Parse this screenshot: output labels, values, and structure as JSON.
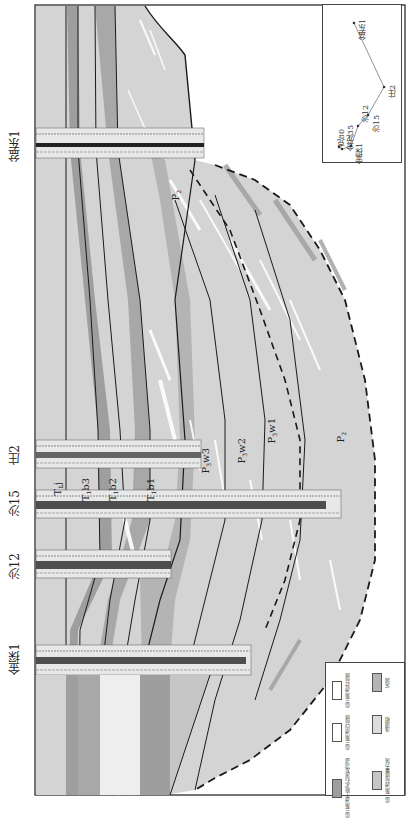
{
  "figure": {
    "type": "well-correlation cross-section (rotated 90°)",
    "colors": {
      "frame": "#1a1a1a",
      "outer_front": "#d4d4d4",
      "inner_front": "#e6e6e6",
      "distributary_channel": "#9e9e9e",
      "shore_mud": "#b4b4b4",
      "shallow_lake": "#dcdcdc",
      "fan_delta_front_sheet": "#c6c6c6",
      "white_sand": "#ffffff"
    }
  },
  "wells": [
    {
      "name": "盆东1",
      "y": 145
    },
    {
      "name": "庄2",
      "y": 455
    },
    {
      "name": "沙15",
      "y": 505
    },
    {
      "name": "沙12",
      "y": 565
    },
    {
      "name": "金探1",
      "y": 660
    }
  ],
  "well_log_tracks": [
    "GR",
    "SP",
    "RT",
    "AC"
  ],
  "strata_labels": [
    {
      "text": "T",
      "sub": "1",
      "sup": "j",
      "full": "T1j",
      "x": 58,
      "y": 500
    },
    {
      "text": "T",
      "sub": "1",
      "sup": "b3",
      "full": "T1b3",
      "x": 85,
      "y": 500
    },
    {
      "text": "T",
      "sub": "1",
      "sup": "b2",
      "full": "T1b2",
      "x": 110,
      "y": 500
    },
    {
      "text": "T",
      "sub": "1",
      "sup": "b1",
      "full": "T1b1",
      "x": 148,
      "y": 500
    },
    {
      "text": "P",
      "sub": "3",
      "sup": "w3",
      "full": "P3w3",
      "x": 205,
      "y": 470
    },
    {
      "text": "P",
      "sub": "3",
      "sup": "w2",
      "full": "P3w2",
      "x": 240,
      "y": 460
    },
    {
      "text": "P",
      "sub": "3",
      "sup": "w1",
      "full": "P3w1",
      "x": 270,
      "y": 440
    },
    {
      "text": "P",
      "sub": "2",
      "sup": "",
      "full": "P2 (lower)",
      "x": 338,
      "y": 440
    },
    {
      "text": "P",
      "sub": "2",
      "sup": "",
      "full": "P2 (upper)",
      "x": 175,
      "y": 195
    }
  ],
  "inset_map": {
    "title": "井位图",
    "wells": [
      {
        "name": "盆东1",
        "x": 353,
        "y": 22
      },
      {
        "name": "庄2",
        "x": 383,
        "y": 86
      },
      {
        "name": "沙15",
        "x": 367,
        "y": 114
      },
      {
        "name": "沙12",
        "x": 357,
        "y": 125
      },
      {
        "name": "金探1",
        "x": 350,
        "y": 145
      },
      {
        "name": "金龙35",
        "x": 341,
        "y": 148
      },
      {
        "name": "克80",
        "x": 338,
        "y": 146
      }
    ]
  },
  "legend": {
    "items": [
      {
        "label": "扇三角洲外前缘",
        "color": "#ffffff"
      },
      {
        "label": "滨湖",
        "color": "#b4b4b4"
      },
      {
        "label": "扇三角洲内前缘",
        "color": "#ffffff"
      },
      {
        "label": "浅湖相",
        "color": "#dcdcdc"
      },
      {
        "label": "扇三角洲平原泥石流及河道",
        "color": "#9e9e9e"
      },
      {
        "label": "扇三角洲前缘重力流",
        "color": "#c6c6c6"
      }
    ]
  }
}
